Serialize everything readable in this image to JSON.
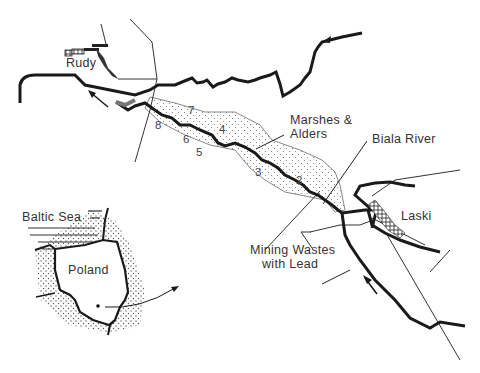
{
  "map": {
    "labels": {
      "rudy": "Rudy",
      "marshes": "Marshes &",
      "alders": "Alders",
      "biala_river": "Biala River",
      "laski": "Laski",
      "mining_wastes_line1": "Mining Wastes",
      "mining_wastes_line2": "with Lead",
      "baltic_sea": "Baltic Sea",
      "poland": "Poland"
    },
    "site_numbers": [
      "2",
      "3",
      "4",
      "5",
      "6",
      "7",
      "8"
    ],
    "colors": {
      "line": "#1a1a1a",
      "text": "#333333",
      "stipple": "#555555",
      "background": "#ffffff"
    },
    "icons": [
      "flow-arrow-icon",
      "town-symbol-icon",
      "location-dot-icon"
    ]
  }
}
